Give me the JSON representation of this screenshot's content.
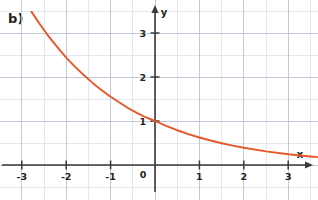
{
  "figure": {
    "part_label": "b)",
    "background_color": "#ffffff"
  },
  "chart_data": {
    "type": "line",
    "title": "",
    "subtitle": "",
    "xlabel": "x",
    "ylabel": "y",
    "annotations": [
      "b)"
    ],
    "legend": [],
    "legend_position": "none",
    "grid": true,
    "grid_major_step_x": 1,
    "grid_major_step_y": 1,
    "grid_minor_step_x": 0.5,
    "grid_minor_step_y": 0.5,
    "grid_major_color": "#b9c4d4",
    "grid_minor_color": "#dde3ec",
    "axis_color": "#3a3a3a",
    "curve_color": "#e8562a",
    "xlim": [
      -6.6,
      6.7
    ],
    "ylim": [
      -0.35,
      3.45
    ],
    "xticks": [
      -6,
      -5,
      -4,
      -3,
      -2,
      -1,
      0,
      1,
      2,
      3,
      4,
      5,
      6
    ],
    "xtick_labels": [
      "-6",
      "-5",
      "-4",
      "-3",
      "-2",
      "-1",
      "0",
      "1",
      "2",
      "3",
      "4",
      "5",
      "6"
    ],
    "yticks": [
      1,
      2,
      3
    ],
    "ytick_labels": [
      "1",
      "2",
      "3"
    ],
    "origin_label": "0",
    "function": "y = 1.6^(-x)",
    "series": [
      {
        "name": "exponential decay",
        "color": "#e8562a",
        "x": [
          -2.78,
          -2.6,
          -2.4,
          -2.2,
          -2.0,
          -1.8,
          -1.6,
          -1.4,
          -1.2,
          -1.0,
          -0.8,
          -0.6,
          -0.4,
          -0.2,
          0.0,
          0.25,
          0.5,
          0.75,
          1.0,
          1.25,
          1.5,
          1.75,
          2.0,
          2.5,
          3.0,
          3.5,
          4.0,
          4.5,
          5.0,
          5.5,
          6.0,
          6.5
        ],
        "y": [
          3.48,
          3.21,
          2.93,
          2.68,
          2.44,
          2.23,
          2.04,
          1.86,
          1.7,
          1.55,
          1.42,
          1.29,
          1.18,
          1.08,
          1.0,
          0.89,
          0.79,
          0.7,
          0.625,
          0.556,
          0.494,
          0.439,
          0.391,
          0.309,
          0.244,
          0.193,
          0.153,
          0.121,
          0.095,
          0.076,
          0.06,
          0.047
        ]
      }
    ]
  }
}
